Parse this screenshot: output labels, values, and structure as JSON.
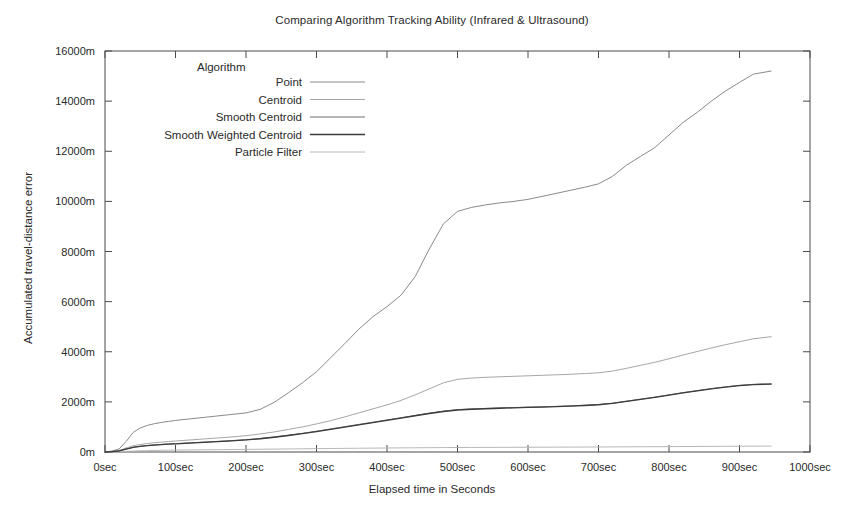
{
  "chart_data": {
    "type": "line",
    "title": "Comparing Algorithm Tracking Ability (Infrared & Ultrasound)",
    "xlabel": "Elapsed time in Seconds",
    "ylabel": "Accumulated travel-distance error",
    "xlim": [
      0,
      1000
    ],
    "ylim": [
      0,
      16000
    ],
    "grid": false,
    "legend_position": "inside-top-left",
    "legend_title": "Algorithm",
    "x_tick_labels": [
      "0sec",
      "100sec",
      "200sec",
      "300sec",
      "400sec",
      "500sec",
      "600sec",
      "700sec",
      "800sec",
      "900sec",
      "1000sec"
    ],
    "x_tick_values": [
      0,
      100,
      200,
      300,
      400,
      500,
      600,
      700,
      800,
      900,
      1000
    ],
    "y_tick_labels": [
      "0m",
      "2000m",
      "4000m",
      "6000m",
      "8000m",
      "10000m",
      "12000m",
      "14000m",
      "16000m"
    ],
    "y_tick_values": [
      0,
      2000,
      4000,
      6000,
      8000,
      10000,
      12000,
      14000,
      16000
    ],
    "x": [
      0,
      10,
      20,
      30,
      40,
      50,
      60,
      70,
      80,
      90,
      100,
      120,
      140,
      160,
      180,
      200,
      220,
      240,
      260,
      280,
      300,
      320,
      340,
      360,
      380,
      400,
      420,
      440,
      460,
      480,
      500,
      520,
      540,
      560,
      580,
      600,
      620,
      640,
      660,
      680,
      700,
      720,
      740,
      760,
      780,
      800,
      820,
      840,
      860,
      880,
      900,
      920,
      945
    ],
    "series": [
      {
        "name": "Point",
        "color": "#8a8a8a",
        "width": 1.0,
        "values": [
          0,
          40,
          120,
          420,
          780,
          960,
          1060,
          1130,
          1180,
          1220,
          1260,
          1320,
          1380,
          1440,
          1500,
          1560,
          1700,
          1980,
          2360,
          2760,
          3200,
          3760,
          4320,
          4900,
          5400,
          5800,
          6260,
          7000,
          8100,
          9100,
          9600,
          9760,
          9860,
          9940,
          10000,
          10080,
          10200,
          10320,
          10440,
          10560,
          10700,
          11000,
          11450,
          11800,
          12150,
          12650,
          13150,
          13550,
          14000,
          14400,
          14750,
          15080,
          15200
        ]
      },
      {
        "name": "Centroid",
        "color": "#a6a6a6",
        "width": 1.0,
        "values": [
          0,
          20,
          60,
          160,
          250,
          300,
          340,
          370,
          395,
          420,
          440,
          480,
          520,
          560,
          600,
          650,
          720,
          800,
          900,
          1000,
          1120,
          1250,
          1400,
          1560,
          1720,
          1880,
          2060,
          2280,
          2520,
          2760,
          2900,
          2950,
          2980,
          3000,
          3020,
          3040,
          3060,
          3080,
          3100,
          3130,
          3160,
          3230,
          3340,
          3460,
          3580,
          3720,
          3870,
          4010,
          4150,
          4280,
          4400,
          4520,
          4600
        ]
      },
      {
        "name": "Smooth Centroid",
        "color": "#6e6e6e",
        "width": 1.0,
        "values": [
          0,
          15,
          45,
          120,
          190,
          230,
          260,
          285,
          305,
          320,
          335,
          365,
          395,
          425,
          455,
          490,
          540,
          600,
          670,
          745,
          830,
          920,
          1010,
          1100,
          1190,
          1280,
          1370,
          1460,
          1550,
          1630,
          1690,
          1720,
          1740,
          1760,
          1775,
          1790,
          1805,
          1820,
          1840,
          1865,
          1895,
          1950,
          2030,
          2110,
          2190,
          2280,
          2370,
          2450,
          2530,
          2600,
          2660,
          2700,
          2720
        ]
      },
      {
        "name": "Smooth Weighted Centroid",
        "color": "#3c3c3c",
        "width": 1.3,
        "values": [
          0,
          14,
          42,
          115,
          182,
          222,
          252,
          276,
          296,
          312,
          326,
          356,
          386,
          416,
          446,
          480,
          528,
          588,
          658,
          732,
          816,
          906,
          996,
          1086,
          1176,
          1266,
          1356,
          1446,
          1536,
          1616,
          1676,
          1706,
          1726,
          1746,
          1762,
          1778,
          1794,
          1810,
          1830,
          1856,
          1886,
          1942,
          2022,
          2102,
          2182,
          2272,
          2362,
          2442,
          2522,
          2592,
          2652,
          2692,
          2712
        ]
      },
      {
        "name": "Particle Filter",
        "color": "#b8b8b8",
        "width": 1.0,
        "values": [
          0,
          5,
          12,
          25,
          38,
          48,
          55,
          62,
          67,
          72,
          76,
          82,
          88,
          94,
          99,
          104,
          110,
          116,
          122,
          128,
          134,
          140,
          145,
          150,
          155,
          160,
          164,
          168,
          172,
          176,
          179,
          182,
          184,
          186,
          188,
          190,
          192,
          194,
          196,
          198,
          200,
          203,
          206,
          209,
          212,
          215,
          218,
          221,
          224,
          227,
          230,
          233,
          236
        ]
      }
    ]
  },
  "legend": {
    "title": "Algorithm",
    "items": [
      {
        "label": "Point"
      },
      {
        "label": "Centroid"
      },
      {
        "label": "Smooth Centroid"
      },
      {
        "label": "Smooth Weighted Centroid"
      },
      {
        "label": "Particle Filter"
      }
    ]
  },
  "axis_frame_color": "#4a4a4a"
}
